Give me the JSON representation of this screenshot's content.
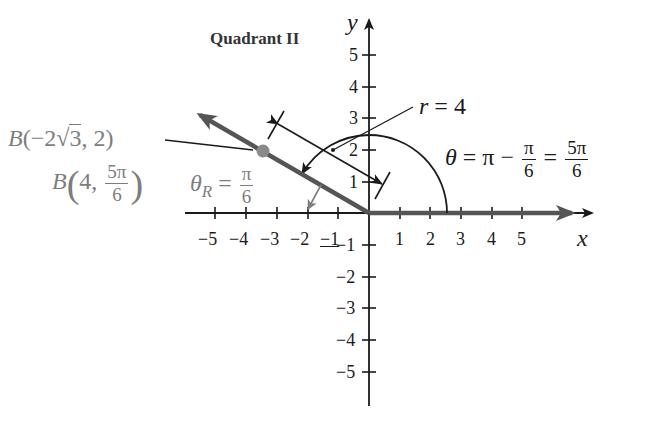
{
  "diagram": {
    "title": "Quadrant II",
    "axes": {
      "x_label": "x",
      "y_label": "y",
      "x_ticks": [
        "−5",
        "−4",
        "−3",
        "−2",
        "−1",
        "1",
        "2",
        "3",
        "4",
        "5"
      ],
      "y_ticks_positive": [
        "5",
        "4",
        "3",
        "2",
        "1"
      ],
      "y_ticks_negative": [
        "−1",
        "−2",
        "−3",
        "−4",
        "−5"
      ]
    },
    "point": {
      "name": "B",
      "rectangular_label": "B(−2√3, 2)",
      "rect_prefix": "B(−2",
      "rect_sqrt_arg": "3",
      "rect_suffix": ", 2)",
      "polar_prefix": "B",
      "polar_r": "4,",
      "polar_theta_num": "5π",
      "polar_theta_den": "6",
      "color": "#7d7d7d"
    },
    "radius_label": {
      "lhs": "r",
      "rhs": "= 4"
    },
    "angle_label": {
      "lhs": "θ",
      "eq1": "= π −",
      "frac1_num": "π",
      "frac1_den": "6",
      "eq2": "=",
      "frac2_num": "5π",
      "frac2_den": "6"
    },
    "reference_angle_label": {
      "lhs": "θ",
      "sub": "R",
      "eq": "=",
      "frac_num": "π",
      "frac_den": "6",
      "color": "#7d7d7d"
    },
    "colors": {
      "axis": "#1a1a1a",
      "terminal_side": "#555555",
      "point": "#8a8a8a",
      "reference": "#7d7d7d"
    }
  }
}
